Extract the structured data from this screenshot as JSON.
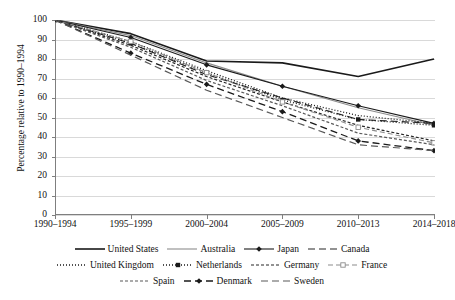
{
  "chart_data": {
    "type": "line",
    "title": "",
    "xlabel": "",
    "ylabel": "Percentage relative to 1990–1994",
    "ylim": [
      0,
      100
    ],
    "ytick_step": 10,
    "yticks": [
      0,
      10,
      20,
      30,
      40,
      50,
      60,
      70,
      80,
      90,
      100
    ],
    "grid": true,
    "legend_position": "bottom",
    "categories": [
      "1990–1994",
      "1995–1999",
      "2000–2004",
      "2005–2009",
      "2010–2013",
      "2014–2018"
    ],
    "series": [
      {
        "name": "United States",
        "values": [
          100,
          93,
          79,
          78,
          71,
          80
        ],
        "style": "solid",
        "marker": "none",
        "color": "#1a1a1a",
        "width": 1.6
      },
      {
        "name": "Australia",
        "values": [
          100,
          92,
          78,
          66,
          55,
          46
        ],
        "style": "solid",
        "marker": "none",
        "color": "#8c8c8c",
        "width": 1.1
      },
      {
        "name": "Japan",
        "values": [
          100,
          91,
          77,
          66,
          56,
          47
        ],
        "style": "solid",
        "marker": "diamond",
        "color": "#1a1a1a",
        "width": 1.1
      },
      {
        "name": "Canada",
        "values": [
          100,
          88,
          72,
          60,
          49,
          47
        ],
        "style": "dash-long",
        "marker": "none",
        "color": "#262626",
        "width": 1.2
      },
      {
        "name": "United Kingdom",
        "values": [
          100,
          89,
          74,
          60,
          51,
          47
        ],
        "style": "dotted",
        "marker": "none",
        "color": "#1a1a1a",
        "width": 1.3
      },
      {
        "name": "Netherlands",
        "values": [
          100,
          88,
          73,
          59,
          49,
          46
        ],
        "style": "dotted",
        "marker": "square-filled",
        "color": "#1a1a1a",
        "width": 1.3
      },
      {
        "name": "Germany",
        "values": [
          100,
          87,
          71,
          58,
          46,
          38
        ],
        "style": "dash-short",
        "marker": "none",
        "color": "#262626",
        "width": 1.2
      },
      {
        "name": "France",
        "values": [
          100,
          89,
          73,
          58,
          45,
          37
        ],
        "style": "dash-med",
        "marker": "square-open",
        "color": "#8c8c8c",
        "width": 1.1
      },
      {
        "name": "Spain",
        "values": [
          100,
          86,
          69,
          56,
          42,
          36
        ],
        "style": "dash-short",
        "marker": "none",
        "color": "#595959",
        "width": 1.2
      },
      {
        "name": "Denmark",
        "values": [
          100,
          83,
          67,
          53,
          38,
          33
        ],
        "style": "dash-long",
        "marker": "diamond",
        "color": "#1a1a1a",
        "width": 1.3
      },
      {
        "name": "Sweden",
        "values": [
          100,
          82,
          64,
          50,
          36,
          33
        ],
        "style": "dash-long",
        "marker": "none",
        "color": "#595959",
        "width": 1.2
      }
    ]
  },
  "legend": {
    "rows": [
      [
        "United States",
        "Australia",
        "Japan",
        "Canada"
      ],
      [
        "United Kingdom",
        "Netherlands",
        "Germany",
        "France"
      ],
      [
        "Spain",
        "Denmark",
        "Sweden"
      ]
    ]
  },
  "axis": {
    "y_title": "Percentage relative to 1990–1994"
  }
}
